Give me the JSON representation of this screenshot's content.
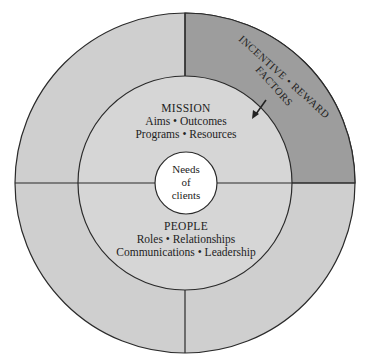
{
  "diagram": {
    "colors": {
      "background": "#ffffff",
      "outer_ring": "#cfcfcf",
      "highlight_quadrant": "#9d9d9d",
      "middle_circle": "#d6d6d6",
      "center_circle": "#ffffff",
      "stroke": "#2a2a2a"
    },
    "center": {
      "line1": "Needs",
      "line2": "of",
      "line3": "clients"
    },
    "mission": {
      "title": "MISSION",
      "line1": "Aims • Outcomes",
      "line2": "Programs • Resources"
    },
    "people": {
      "title": "PEOPLE",
      "line1": "Roles • Relationships",
      "line2": "Communications • Leadership"
    },
    "highlight": {
      "line1": "INCENTIVE • REWARD",
      "line2": "FACTORS"
    },
    "arrow": {
      "direction": "inward"
    }
  }
}
